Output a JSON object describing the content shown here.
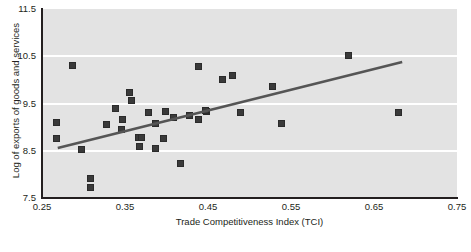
{
  "chart_data": {
    "type": "scatter",
    "title": "",
    "xlabel": "Trade Competitiveness Index (TCI)",
    "ylabel": "Log of exports of goods and services",
    "xlim": [
      0.25,
      0.75
    ],
    "ylim": [
      7.5,
      11.5
    ],
    "xticks": [
      "0.25",
      "0.35",
      "0.45",
      "0.55",
      "0.65",
      "0.75"
    ],
    "xtick_values": [
      0.25,
      0.35,
      0.45,
      0.55,
      0.65,
      0.75
    ],
    "yticks": [
      "11.5",
      "10.5",
      "9.5",
      "8.5",
      "7.5"
    ],
    "ytick_values": [
      11.5,
      10.5,
      9.5,
      8.5,
      7.5
    ],
    "grid": "horizontal-white-gridlines",
    "legend": "none",
    "plot_background": "#e3e3e3",
    "marker_color": "#3a3a3a",
    "marker_shape": "square",
    "trendline": {
      "color": "#555555",
      "x_start": 0.269,
      "y_start": 8.56,
      "x_end": 0.684,
      "y_end": 10.38
    },
    "points": [
      {
        "x": 0.287,
        "y": 10.3
      },
      {
        "x": 0.356,
        "y": 9.74
      },
      {
        "x": 0.338,
        "y": 9.4
      },
      {
        "x": 0.267,
        "y": 9.1
      },
      {
        "x": 0.328,
        "y": 9.06
      },
      {
        "x": 0.347,
        "y": 9.16
      },
      {
        "x": 0.267,
        "y": 8.76
      },
      {
        "x": 0.366,
        "y": 8.78
      },
      {
        "x": 0.297,
        "y": 8.52
      },
      {
        "x": 0.308,
        "y": 7.92
      },
      {
        "x": 0.308,
        "y": 7.73
      },
      {
        "x": 0.438,
        "y": 10.28
      },
      {
        "x": 0.358,
        "y": 9.57
      },
      {
        "x": 0.378,
        "y": 9.3
      },
      {
        "x": 0.399,
        "y": 9.34
      },
      {
        "x": 0.408,
        "y": 9.21
      },
      {
        "x": 0.428,
        "y": 9.25
      },
      {
        "x": 0.448,
        "y": 9.34
      },
      {
        "x": 0.387,
        "y": 9.08
      },
      {
        "x": 0.438,
        "y": 9.17
      },
      {
        "x": 0.346,
        "y": 8.94
      },
      {
        "x": 0.37,
        "y": 8.77
      },
      {
        "x": 0.396,
        "y": 8.75
      },
      {
        "x": 0.367,
        "y": 8.58
      },
      {
        "x": 0.387,
        "y": 8.54
      },
      {
        "x": 0.417,
        "y": 8.24
      },
      {
        "x": 0.479,
        "y": 10.1
      },
      {
        "x": 0.468,
        "y": 10.0
      },
      {
        "x": 0.528,
        "y": 9.85
      },
      {
        "x": 0.447,
        "y": 9.36
      },
      {
        "x": 0.489,
        "y": 9.31
      },
      {
        "x": 0.539,
        "y": 9.08
      },
      {
        "x": 0.619,
        "y": 10.52
      },
      {
        "x": 0.679,
        "y": 9.3
      }
    ]
  }
}
